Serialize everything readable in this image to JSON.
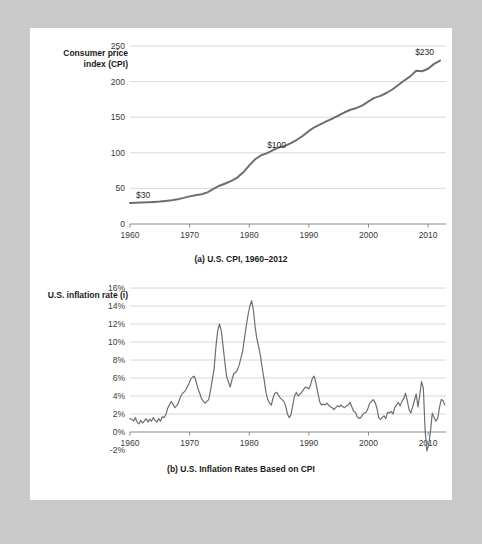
{
  "figure": {
    "background_color": "#c9c9c9",
    "card_color": "#ffffff",
    "line_color": "#6e6e6e",
    "grid_color": "#d8d8d8",
    "axis_color": "#8a8a8a"
  },
  "chart_data": [
    {
      "type": "line",
      "id": "cpi",
      "title": "(a) U.S. CPI, 1960–2012",
      "ylabel": "Consumer price index (CPI)",
      "xlabel": "",
      "xlim": [
        1960,
        2013
      ],
      "ylim": [
        0,
        250
      ],
      "grid": true,
      "legend": "none",
      "yticks": [
        0,
        50,
        100,
        150,
        200,
        250
      ],
      "ytick_labels": [
        "0",
        "50",
        "100",
        "150",
        "200",
        "250"
      ],
      "xticks": [
        1960,
        1970,
        1980,
        1990,
        2000,
        2010
      ],
      "xtick_labels": [
        "1960",
        "1970",
        "1980",
        "1990",
        "2000",
        "2010"
      ],
      "annotations": [
        {
          "text": "$30",
          "x": 1961,
          "y": 30
        },
        {
          "text": "$100",
          "x": 1983,
          "y": 100
        },
        {
          "text": "$230",
          "x": 2011,
          "y": 230
        }
      ],
      "x": [
        1960,
        1961,
        1962,
        1963,
        1964,
        1965,
        1966,
        1967,
        1968,
        1969,
        1970,
        1971,
        1972,
        1973,
        1974,
        1975,
        1976,
        1977,
        1978,
        1979,
        1980,
        1981,
        1982,
        1983,
        1984,
        1985,
        1986,
        1987,
        1988,
        1989,
        1990,
        1991,
        1992,
        1993,
        1994,
        1995,
        1996,
        1997,
        1998,
        1999,
        2000,
        2001,
        2002,
        2003,
        2004,
        2005,
        2006,
        2007,
        2008,
        2009,
        2010,
        2011,
        2012
      ],
      "values": [
        29.6,
        29.9,
        30.2,
        30.6,
        31.0,
        31.5,
        32.4,
        33.4,
        34.8,
        36.7,
        38.8,
        40.5,
        41.8,
        44.4,
        49.3,
        53.8,
        56.9,
        60.6,
        65.2,
        72.6,
        82.4,
        90.9,
        96.5,
        99.6,
        103.9,
        107.6,
        109.6,
        113.6,
        118.3,
        124.0,
        130.7,
        136.2,
        140.3,
        144.5,
        148.2,
        152.4,
        156.9,
        160.5,
        163.0,
        166.6,
        172.2,
        177.1,
        179.9,
        184.0,
        188.9,
        195.3,
        201.6,
        207.3,
        215.3,
        214.5,
        218.1,
        224.9,
        229.6
      ]
    },
    {
      "type": "line",
      "id": "inflation",
      "title": "(b) U.S. Inflation Rates Based on CPI",
      "ylabel": "U.S. inflation rate (i)",
      "xlabel": "",
      "xlim": [
        1960,
        2013
      ],
      "ylim": [
        -2,
        16
      ],
      "grid": true,
      "legend": "none",
      "yticks": [
        -2,
        0,
        2,
        4,
        6,
        8,
        10,
        12,
        14,
        16
      ],
      "ytick_labels": [
        "-2%",
        "0%",
        "2%",
        "4%",
        "6%",
        "8%",
        "10%",
        "12%",
        "14%",
        "16%"
      ],
      "xticks": [
        1960,
        1970,
        1980,
        1990,
        2000,
        2010
      ],
      "xtick_labels": [
        "1960",
        "1970",
        "1980",
        "1990",
        "2000",
        "2010"
      ],
      "x": [
        1960.0,
        1960.3,
        1960.6,
        1960.9,
        1961.2,
        1961.5,
        1961.8,
        1962.1,
        1962.4,
        1962.7,
        1963.0,
        1963.3,
        1963.6,
        1963.9,
        1964.2,
        1964.5,
        1964.8,
        1965.1,
        1965.4,
        1965.7,
        1966.0,
        1966.3,
        1966.6,
        1966.9,
        1967.2,
        1967.5,
        1967.8,
        1968.1,
        1968.4,
        1968.7,
        1969.0,
        1969.3,
        1969.6,
        1969.9,
        1970.2,
        1970.5,
        1970.8,
        1971.1,
        1971.4,
        1971.7,
        1972.0,
        1972.3,
        1972.6,
        1972.9,
        1973.2,
        1973.5,
        1973.8,
        1974.1,
        1974.4,
        1974.7,
        1975.0,
        1975.3,
        1975.6,
        1975.9,
        1976.2,
        1976.5,
        1976.8,
        1977.1,
        1977.4,
        1977.7,
        1978.0,
        1978.3,
        1978.6,
        1978.9,
        1979.2,
        1979.5,
        1979.8,
        1980.1,
        1980.4,
        1980.7,
        1981.0,
        1981.3,
        1981.6,
        1981.9,
        1982.2,
        1982.5,
        1982.8,
        1983.1,
        1983.4,
        1983.7,
        1984.0,
        1984.3,
        1984.6,
        1984.9,
        1985.2,
        1985.5,
        1985.8,
        1986.1,
        1986.4,
        1986.7,
        1987.0,
        1987.3,
        1987.6,
        1987.9,
        1988.2,
        1988.5,
        1988.8,
        1989.1,
        1989.4,
        1989.7,
        1990.0,
        1990.3,
        1990.6,
        1990.9,
        1991.2,
        1991.5,
        1991.8,
        1992.1,
        1992.4,
        1992.7,
        1993.0,
        1993.3,
        1993.6,
        1993.9,
        1994.2,
        1994.5,
        1994.8,
        1995.1,
        1995.4,
        1995.7,
        1996.0,
        1996.3,
        1996.6,
        1996.9,
        1997.2,
        1997.5,
        1997.8,
        1998.1,
        1998.4,
        1998.7,
        1999.0,
        1999.3,
        1999.6,
        1999.9,
        2000.2,
        2000.5,
        2000.8,
        2001.1,
        2001.4,
        2001.7,
        2002.0,
        2002.3,
        2002.6,
        2002.9,
        2003.2,
        2003.5,
        2003.8,
        2004.1,
        2004.4,
        2004.7,
        2005.0,
        2005.3,
        2005.6,
        2005.9,
        2006.2,
        2006.5,
        2006.8,
        2007.1,
        2007.4,
        2007.7,
        2008.0,
        2008.3,
        2008.6,
        2008.9,
        2009.2,
        2009.5,
        2009.8,
        2010.1,
        2010.4,
        2010.7,
        2011.0,
        2011.3,
        2011.6,
        2011.9,
        2012.2,
        2012.5,
        2012.8
      ],
      "values": [
        1.5,
        1.4,
        1.2,
        1.6,
        1.1,
        0.9,
        1.3,
        1.0,
        1.2,
        1.5,
        1.1,
        1.4,
        1.2,
        1.6,
        1.3,
        1.1,
        1.5,
        1.2,
        1.7,
        1.6,
        1.9,
        2.6,
        3.0,
        3.4,
        3.1,
        2.7,
        2.9,
        3.2,
        3.8,
        4.2,
        4.4,
        4.6,
        5.0,
        5.4,
        5.9,
        6.1,
        6.2,
        5.6,
        4.8,
        4.3,
        3.7,
        3.4,
        3.2,
        3.4,
        3.6,
        4.6,
        5.8,
        7.0,
        9.4,
        11.2,
        12.0,
        11.3,
        9.6,
        7.8,
        6.2,
        5.6,
        5.0,
        5.8,
        6.5,
        6.6,
        6.9,
        7.4,
        8.2,
        9.0,
        10.4,
        11.8,
        13.0,
        14.0,
        14.6,
        13.5,
        11.6,
        10.3,
        9.4,
        8.4,
        7.0,
        5.8,
        4.4,
        3.6,
        3.2,
        3.0,
        3.8,
        4.3,
        4.4,
        4.1,
        3.8,
        3.6,
        3.4,
        2.9,
        2.0,
        1.6,
        1.9,
        3.0,
        4.0,
        4.4,
        4.0,
        4.2,
        4.4,
        4.7,
        5.0,
        4.9,
        4.8,
        5.3,
        6.0,
        6.2,
        5.4,
        4.4,
        3.4,
        3.0,
        3.1,
        3.0,
        3.2,
        3.0,
        2.8,
        2.7,
        2.5,
        2.7,
        2.9,
        2.8,
        3.0,
        2.8,
        2.7,
        2.9,
        3.0,
        3.3,
        2.8,
        2.3,
        2.2,
        1.7,
        1.5,
        1.6,
        1.9,
        2.1,
        2.2,
        2.6,
        3.2,
        3.4,
        3.6,
        3.3,
        2.7,
        1.6,
        1.4,
        1.6,
        1.8,
        1.5,
        2.2,
        2.1,
        2.3,
        2.0,
        2.7,
        3.0,
        3.3,
        2.9,
        3.4,
        3.7,
        4.3,
        3.5,
        2.5,
        2.1,
        2.8,
        3.5,
        4.2,
        2.8,
        4.1,
        5.6,
        4.9,
        0.1,
        -2.1,
        -1.4,
        0.1,
        2.1,
        1.6,
        1.2,
        1.5,
        2.7,
        3.6,
        3.5,
        3.0,
        2.3,
        2.0,
        1.7
      ]
    }
  ]
}
